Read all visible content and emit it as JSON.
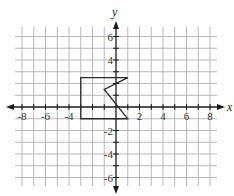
{
  "chart_data": {
    "type": "line",
    "title": "",
    "xlabel": "x",
    "ylabel": "y",
    "xlim": [
      -8.5,
      8.5
    ],
    "ylim": [
      -6.5,
      6.5
    ],
    "grid": true,
    "grid_x": [
      -8,
      -7,
      -6,
      -5,
      -4,
      -3,
      -2,
      -1,
      0,
      1,
      2,
      3,
      4,
      5,
      6,
      7,
      8
    ],
    "grid_y": [
      -6,
      -5,
      -4,
      -3,
      -2,
      -1,
      0,
      1,
      2,
      3,
      4,
      5,
      6
    ],
    "x_tick_labels": [
      "-8",
      "-6",
      "-4",
      "2",
      "4",
      "6",
      "8"
    ],
    "x_tick_values": [
      -8,
      -6,
      -4,
      2,
      4,
      6,
      8
    ],
    "y_tick_labels": [
      "6",
      "4",
      "-2",
      "-4",
      "-6"
    ],
    "y_tick_values": [
      6,
      4,
      -2,
      -4,
      -6
    ],
    "series": [
      {
        "name": "polygon",
        "closed": true,
        "points": [
          [
            -3,
            2.5
          ],
          [
            1,
            2.5
          ],
          [
            -1,
            1.5
          ],
          [
            1,
            -1
          ],
          [
            -3,
            -1
          ]
        ]
      }
    ]
  },
  "colors": {
    "grid": "#a8a8a8",
    "axis": "#1a1a1a",
    "shape": "#2a2a2a",
    "text": "#333333"
  }
}
